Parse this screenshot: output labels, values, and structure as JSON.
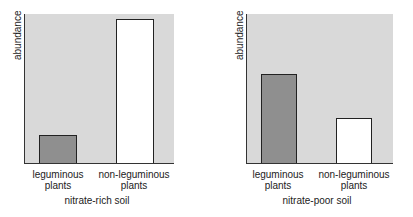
{
  "chart_data": [
    {
      "type": "bar",
      "title": "",
      "xlabel": "nitrate-rich soil",
      "ylabel": "abundance",
      "categories": [
        "leguminous plants",
        "non-leguminous plants"
      ],
      "category_lines": [
        [
          "leguminous",
          "plants"
        ],
        [
          "non-leguminous",
          "plants"
        ]
      ],
      "values": [
        0.19,
        0.97
      ],
      "ylim": [
        0,
        1
      ],
      "units": "relative (no tick values shown)",
      "grid": false,
      "colors": [
        "#8f8f8f",
        "#ffffff"
      ]
    },
    {
      "type": "bar",
      "title": "",
      "xlabel": "nitrate-poor soil",
      "ylabel": "abundance",
      "categories": [
        "leguminous plants",
        "non-leguminous plants"
      ],
      "category_lines": [
        [
          "leguminous",
          "plants"
        ],
        [
          "non-leguminous",
          "plants"
        ]
      ],
      "values": [
        0.6,
        0.3
      ],
      "ylim": [
        0,
        1
      ],
      "units": "relative (no tick values shown)",
      "grid": false,
      "colors": [
        "#8f8f8f",
        "#ffffff"
      ]
    }
  ],
  "colors": {
    "plot_background": "#d9d9d9",
    "leguminous_bar": "#8f8f8f",
    "non_leguminous_bar": "#ffffff",
    "axis": "#333333"
  }
}
